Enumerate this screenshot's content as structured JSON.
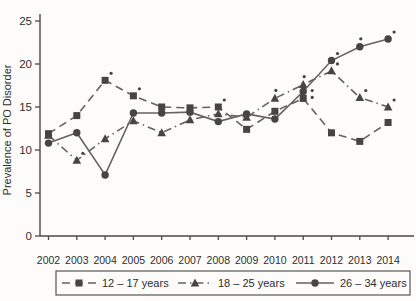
{
  "chart_data": {
    "type": "line",
    "title": "",
    "xlabel": "",
    "ylabel": "Prevalence of PO Disorder",
    "ylim": [
      0,
      25
    ],
    "yticks": [
      0,
      5,
      10,
      15,
      20,
      25
    ],
    "grid": false,
    "legend_position": "bottom",
    "categories": [
      "2002",
      "2003",
      "2004",
      "2005",
      "2006",
      "2007",
      "2008",
      "2009",
      "2010",
      "2011",
      "2012",
      "2013",
      "2014"
    ],
    "series": [
      {
        "name": "12 – 17 years",
        "marker": "square",
        "line_style": "dashed",
        "values": [
          11.9,
          14.0,
          18.1,
          16.3,
          15.0,
          14.9,
          15.0,
          12.4,
          14.5,
          16.0,
          12.0,
          11.0,
          13.2
        ],
        "significance_marks": [
          {
            "i": 2,
            "pos": "ar"
          },
          {
            "i": 3,
            "pos": "ar"
          },
          {
            "i": 6,
            "pos": "ar"
          },
          {
            "i": 9,
            "pos": "r"
          }
        ]
      },
      {
        "name": "18 – 25 years",
        "marker": "triangle",
        "line_style": "dashdot",
        "values": [
          11.7,
          8.8,
          11.3,
          13.4,
          12.0,
          13.5,
          14.2,
          13.8,
          16.0,
          17.6,
          19.2,
          16.1,
          15.0
        ],
        "significance_marks": [
          {
            "i": 1,
            "pos": "ar"
          },
          {
            "i": 8,
            "pos": "a"
          },
          {
            "i": 9,
            "pos": "a"
          },
          {
            "i": 10,
            "pos": "ar"
          },
          {
            "i": 11,
            "pos": "ar"
          },
          {
            "i": 12,
            "pos": "ar"
          }
        ]
      },
      {
        "name": "26 – 34 years",
        "marker": "circle",
        "line_style": "solid",
        "values": [
          10.8,
          12.0,
          7.1,
          14.3,
          14.3,
          14.4,
          13.3,
          14.2,
          13.6,
          16.8,
          20.4,
          22.0,
          22.9
        ],
        "significance_marks": [
          {
            "i": 9,
            "pos": "r"
          },
          {
            "i": 10,
            "pos": "ar"
          },
          {
            "i": 11,
            "pos": "a"
          },
          {
            "i": 12,
            "pos": "ar"
          }
        ]
      }
    ],
    "colors": {
      "line": "#636363",
      "marker": "#454545",
      "text": "#2e2e2e",
      "axis": "#4a4a4a",
      "legend_border": "#555555",
      "background": "#fdfcfa"
    }
  }
}
